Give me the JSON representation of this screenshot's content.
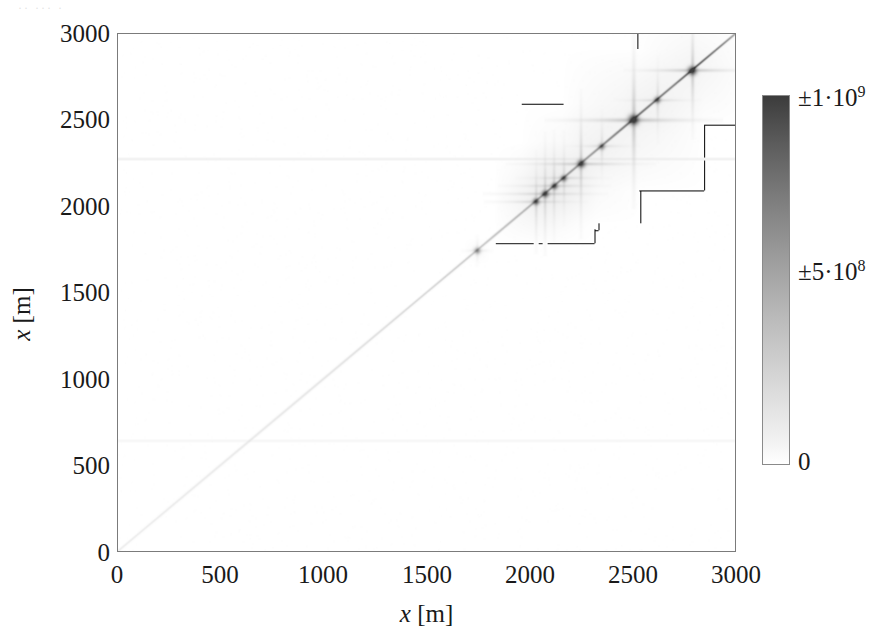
{
  "figure": {
    "background_color": "#ffffff",
    "frame_color": "#7b7b7b"
  },
  "axes": {
    "x_title_var": "x",
    "x_title_unit": "[m]",
    "y_title_var": "x",
    "y_title_unit": "[m]",
    "x_ticks": [
      "0",
      "500",
      "1000",
      "1500",
      "2000",
      "2500",
      "3000"
    ],
    "y_ticks": [
      "3000",
      "2500",
      "2000",
      "1500",
      "1000",
      "500",
      "0"
    ]
  },
  "colorbar": {
    "top_label_main": "±1·10",
    "top_label_exp": "9",
    "mid_label_main": "±5·10",
    "mid_label_exp": "8",
    "bottom_label": "0",
    "low_color": "#ffffff",
    "high_color": "#3c3c3c"
  },
  "artifact": {
    "top_strip_text": "··  ···   ·"
  },
  "chart_data": {
    "type": "heatmap",
    "title": "",
    "subtitle": "",
    "xlabel": "x [m]",
    "ylabel": "x [m]",
    "xlim": [
      0,
      3000
    ],
    "ylim": [
      0,
      3000
    ],
    "grid": false,
    "legend": "colorbar-right",
    "colormap": "grayscale-white-to-dark",
    "colorbar_range": [
      0,
      1000000000
    ],
    "colorbar_ticks": [
      0,
      500000000,
      1000000000
    ],
    "colorbar_tick_labels": [
      "0",
      "±5·10^8",
      "±1·10^9"
    ],
    "diagonal": {
      "present": true,
      "from": [
        0,
        0
      ],
      "to": [
        3000,
        3000
      ],
      "intensity_profile": [
        {
          "x": 0,
          "value": 30000000
        },
        {
          "x": 500,
          "value": 45000000
        },
        {
          "x": 1000,
          "value": 60000000
        },
        {
          "x": 1500,
          "value": 90000000
        },
        {
          "x": 1750,
          "value": 150000000
        },
        {
          "x": 2000,
          "value": 260000000
        },
        {
          "x": 2100,
          "value": 420000000
        },
        {
          "x": 2300,
          "value": 380000000
        },
        {
          "x": 2500,
          "value": 620000000
        },
        {
          "x": 2700,
          "value": 500000000
        },
        {
          "x": 2800,
          "value": 700000000
        },
        {
          "x": 3000,
          "value": 300000000
        }
      ]
    },
    "features": [
      {
        "center": [
          1745,
          1745
        ],
        "peak_value": 330000000,
        "core_radius": 9,
        "streak_half_length": 75,
        "streak_value": 60000000
      },
      {
        "center": [
          2030,
          2030
        ],
        "peak_value": 640000000,
        "core_radius": 10,
        "streak_half_length": 250,
        "streak_value": 110000000
      },
      {
        "center": [
          2075,
          2075
        ],
        "peak_value": 700000000,
        "core_radius": 11,
        "streak_half_length": 300,
        "streak_value": 130000000
      },
      {
        "center": [
          2120,
          2120
        ],
        "peak_value": 620000000,
        "core_radius": 10,
        "streak_half_length": 270,
        "streak_value": 115000000
      },
      {
        "center": [
          2165,
          2165
        ],
        "peak_value": 560000000,
        "core_radius": 9,
        "streak_half_length": 230,
        "streak_value": 95000000
      },
      {
        "center": [
          2250,
          2250
        ],
        "peak_value": 760000000,
        "core_radius": 12,
        "streak_half_length": 360,
        "streak_value": 150000000
      },
      {
        "center": [
          2350,
          2350
        ],
        "peak_value": 430000000,
        "core_radius": 9,
        "streak_half_length": 180,
        "streak_value": 80000000
      },
      {
        "center": [
          2505,
          2505
        ],
        "peak_value": 980000000,
        "core_radius": 15,
        "streak_half_length": 430,
        "streak_value": 190000000
      },
      {
        "center": [
          2620,
          2620
        ],
        "peak_value": 520000000,
        "core_radius": 10,
        "streak_half_length": 210,
        "streak_value": 95000000
      },
      {
        "center": [
          2790,
          2790
        ],
        "peak_value": 880000000,
        "core_radius": 13,
        "streak_half_length": 330,
        "streak_value": 165000000
      }
    ],
    "faint_bands": [
      {
        "orientation": "horizontal",
        "y": 640,
        "value": 12000000
      },
      {
        "orientation": "horizontal",
        "y": 2280,
        "value": 25000000
      }
    ]
  }
}
